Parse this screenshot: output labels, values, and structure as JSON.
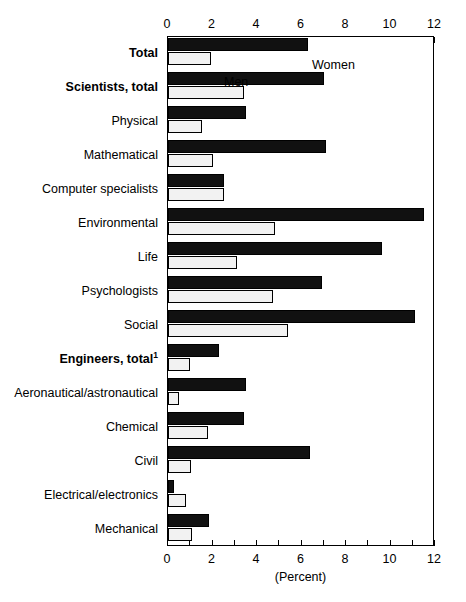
{
  "chart_data": {
    "type": "bar",
    "orientation": "horizontal",
    "title": "",
    "xlabel": "(Percent)",
    "ylabel": "",
    "xlim": [
      0,
      12
    ],
    "xticks": [
      0,
      1,
      2,
      3,
      4,
      5,
      6,
      7,
      8,
      9,
      10,
      11,
      12
    ],
    "xtick_labels": [
      "0",
      "",
      "2",
      "",
      "4",
      "",
      "6",
      "",
      "8",
      "",
      "10",
      "",
      "12"
    ],
    "xtick_labels_shown": [
      "0",
      "2",
      "4",
      "6",
      "8",
      "10",
      "12"
    ],
    "grid": false,
    "legend_position": "inside-top-left",
    "axis_top": true,
    "axis_bottom": true,
    "categories": [
      "Total",
      "Scientists, total",
      "Physical",
      "Mathematical",
      "Computer specialists",
      "Environmental",
      "Life",
      "Psychologists",
      "Social",
      "Engineers, total",
      "Aeronautical/astronautical",
      "Chemical",
      "Civil",
      "Electrical/electronics",
      "Mechanical"
    ],
    "category_bold": [
      true,
      true,
      false,
      false,
      false,
      false,
      false,
      false,
      false,
      true,
      false,
      false,
      false,
      false,
      false
    ],
    "category_footnote": [
      "",
      "",
      "",
      "",
      "",
      "",
      "",
      "",
      "",
      "1",
      "",
      "",
      "",
      "",
      ""
    ],
    "series": [
      {
        "name": "Women",
        "color": "#111111",
        "values": [
          6.3,
          7.0,
          3.5,
          7.1,
          2.5,
          11.5,
          9.6,
          6.9,
          11.1,
          2.3,
          3.5,
          3.4,
          6.4,
          0.25,
          1.85
        ]
      },
      {
        "name": "Men",
        "color": "#f2f2f2",
        "values": [
          1.95,
          3.4,
          1.55,
          2.0,
          2.5,
          4.8,
          3.1,
          4.7,
          5.4,
          1.0,
          0.5,
          1.8,
          1.05,
          0.8,
          1.1
        ]
      }
    ]
  },
  "legend": {
    "women_label": "Women",
    "men_label": "Men"
  },
  "axis": {
    "unit_caption": "(Percent)"
  }
}
